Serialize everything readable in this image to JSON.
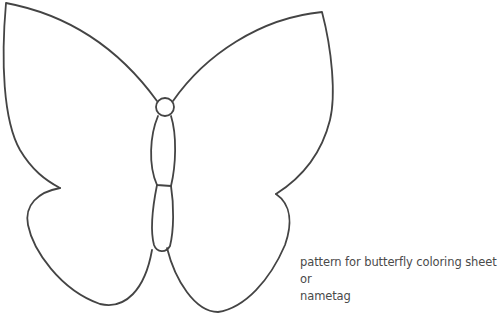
{
  "image": {
    "subject": "butterfly outline",
    "stroke_color": "#444444",
    "background": "#ffffff"
  },
  "caption": {
    "line1": "pattern for butterfly coloring sheet or",
    "line2": "nametag"
  },
  "footer": {
    "text": " "
  }
}
